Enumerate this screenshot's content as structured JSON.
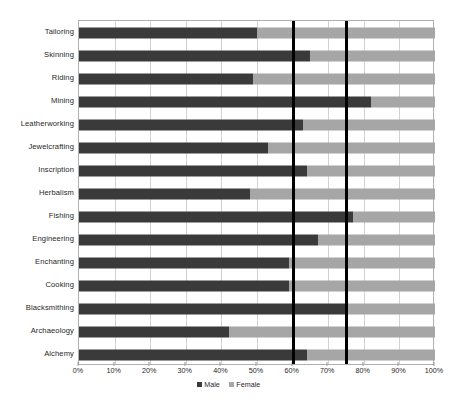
{
  "chart_data": {
    "type": "bar",
    "subtype": "stacked-horizontal-100-percent",
    "title": "",
    "xlabel": "",
    "ylabel": "",
    "xlim": [
      0,
      100
    ],
    "xticks": [
      "0%",
      "10%",
      "20%",
      "30%",
      "40%",
      "50%",
      "60%",
      "70%",
      "80%",
      "90%",
      "100%"
    ],
    "xtick_values": [
      0,
      10,
      20,
      30,
      40,
      50,
      60,
      70,
      80,
      90,
      100
    ],
    "grid": true,
    "legend_position": "bottom",
    "categories": [
      "Tailoring",
      "Skinning",
      "Riding",
      "Mining",
      "Leatherworking",
      "Jewelcrafting",
      "Inscription",
      "Herbalism",
      "Fishing",
      "Engineering",
      "Enchanting",
      "Cooking",
      "Blacksmithing",
      "Archaeology",
      "Alchemy"
    ],
    "series": [
      {
        "name": "Male",
        "color": "#3a3a3a",
        "values": [
          50,
          65,
          49,
          82,
          63,
          53,
          64,
          48,
          77,
          67,
          59,
          59,
          75,
          42,
          64
        ]
      },
      {
        "name": "Female",
        "color": "#a6a6a6",
        "values": [
          50,
          35,
          51,
          18,
          37,
          47,
          36,
          52,
          23,
          33,
          41,
          41,
          25,
          58,
          36
        ]
      }
    ],
    "reference_lines": [
      {
        "value": 60,
        "color": "#000000",
        "label": "60%"
      },
      {
        "value": 75,
        "color": "#000000",
        "label": "75%"
      }
    ]
  },
  "legend": {
    "items": [
      {
        "label": "Male",
        "color": "#3a3a3a"
      },
      {
        "label": "Female",
        "color": "#a6a6a6"
      }
    ]
  },
  "caption": {
    "text": ""
  }
}
